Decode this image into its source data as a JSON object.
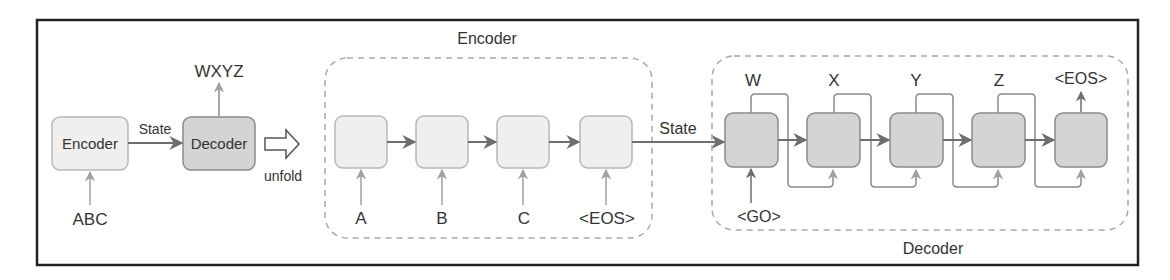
{
  "figure": {
    "summary": {
      "encoder_label": "Encoder",
      "decoder_label": "Decoder",
      "state_label": "State",
      "input_label": "ABC",
      "output_label": "WXYZ",
      "unfold_label": "unfold"
    },
    "encoder_group": {
      "title": "Encoder",
      "state_label": "State",
      "inputs": [
        "A",
        "B",
        "C",
        "<EOS>"
      ]
    },
    "decoder_group": {
      "title": "Decoder",
      "go_label": "<GO>",
      "outputs": [
        "W",
        "X",
        "Y",
        "Z",
        "<EOS>"
      ]
    },
    "colors": {
      "frame": "#222222",
      "encoder_fill": "#efefef",
      "decoder_fill": "#d4d4d4",
      "arrow": "#707070",
      "dashed": "#a8a8a8",
      "text": "#333333"
    }
  }
}
